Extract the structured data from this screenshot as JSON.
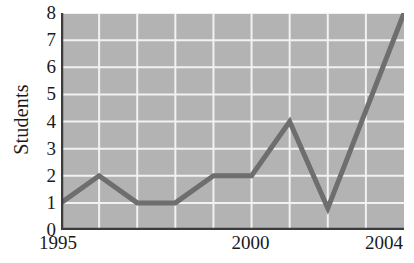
{
  "chart_data": {
    "type": "line",
    "title": "",
    "xlabel": "",
    "ylabel": "Students",
    "x": [
      1995,
      1996,
      1997,
      1998,
      1999,
      2000,
      2001,
      2002,
      2003,
      2004
    ],
    "values": [
      1,
      2,
      1,
      1,
      2,
      2,
      4,
      0.8,
      4.4,
      8
    ],
    "series": [
      {
        "name": "Students",
        "values": [
          1,
          2,
          1,
          1,
          2,
          2,
          4,
          0.8,
          4.4,
          8
        ]
      }
    ],
    "xlim": [
      1995,
      2004
    ],
    "ylim": [
      0,
      8
    ],
    "y_ticks": [
      0,
      1,
      2,
      3,
      4,
      5,
      6,
      7,
      8
    ],
    "y_tick_labels": [
      "0",
      "1",
      "2",
      "3",
      "4",
      "5",
      "6",
      "7",
      "8"
    ],
    "x_ticks": [
      1995,
      2000,
      2004
    ],
    "x_tick_labels": [
      "1995",
      "2000",
      "2004"
    ],
    "grid": true,
    "grid_color": "#f2f2f2",
    "plot_background_color": "#b3b3b3",
    "line_color": "#6e6e6e",
    "line_width": 5,
    "axis_color": "#3c3c3c",
    "legend": null,
    "legend_position": "none",
    "annotations": []
  },
  "axis_titles": {
    "y": "Students"
  }
}
